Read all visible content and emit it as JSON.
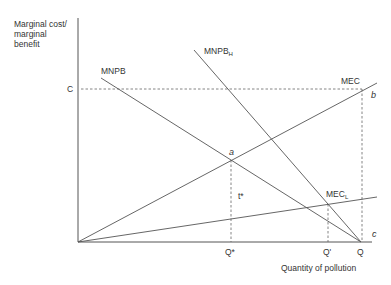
{
  "diagram": {
    "y_axis_label": [
      "Marginal cost/",
      "marginal",
      "benefit"
    ],
    "x_axis_label": "Quantity of pollution",
    "y_tick_labels": {
      "C": "C"
    },
    "x_tick_labels": {
      "q_star": "Q*",
      "q_prime": "Q'",
      "q": "Q"
    },
    "curves": {
      "mnpb": {
        "label": "MNPB"
      },
      "mnpb_h": {
        "label": "MNPB",
        "subscript": "H"
      },
      "mec": {
        "label": "MEC"
      },
      "mec_l": {
        "label": "MEC",
        "subscript": "L"
      }
    },
    "points": {
      "a": "a",
      "b": "b",
      "c": "c"
    },
    "tax_label": "t*"
  }
}
